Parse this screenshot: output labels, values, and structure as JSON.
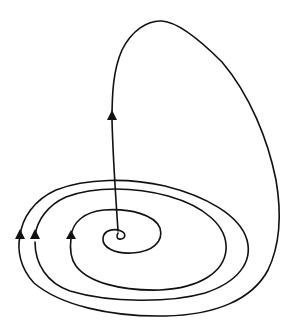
{
  "diagram": {
    "colors": {
      "background": "#ffffff",
      "stroke": "#111111"
    },
    "elements": {
      "spiral_center": {
        "x": 118,
        "y": 233
      },
      "arrows": [
        {
          "id": "arrow-upper",
          "x": 112,
          "y": 116,
          "direction": "up"
        },
        {
          "id": "arrow-outer",
          "x": 20,
          "y": 235,
          "direction": "up"
        },
        {
          "id": "arrow-middle",
          "x": 35,
          "y": 235,
          "direction": "up"
        },
        {
          "id": "arrow-inner",
          "x": 71,
          "y": 235,
          "direction": "up"
        }
      ]
    }
  }
}
